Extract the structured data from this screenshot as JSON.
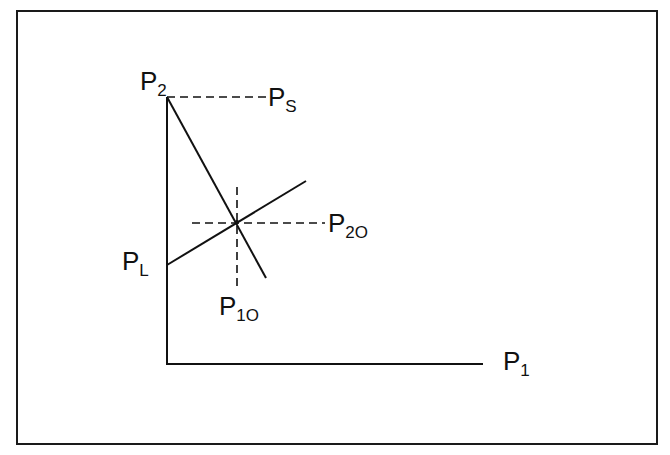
{
  "diagram": {
    "type": "price-line-intersection",
    "labels": {
      "p2": {
        "main": "P",
        "sub": "2"
      },
      "ps": {
        "main": "P",
        "sub": "S"
      },
      "p2o": {
        "main": "P",
        "sub": "2O"
      },
      "pl": {
        "main": "P",
        "sub": "L"
      },
      "p1o": {
        "main": "P",
        "sub": "1O"
      },
      "p1": {
        "main": "P",
        "sub": "1"
      }
    },
    "colors": {
      "line": "#111111",
      "border": "#1a1a1a",
      "background": "#ffffff"
    }
  }
}
